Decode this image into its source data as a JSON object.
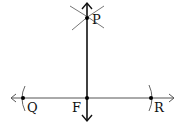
{
  "diagram": {
    "points": [
      {
        "id": "P",
        "label": "P",
        "x": 87,
        "y": 18
      },
      {
        "id": "Q",
        "label": "Q",
        "x": 23,
        "y": 98
      },
      {
        "id": "F",
        "label": "F",
        "x": 87,
        "y": 98
      },
      {
        "id": "R",
        "label": "R",
        "x": 151,
        "y": 98
      }
    ],
    "lines": [
      {
        "id": "QR-line",
        "from": [
          10,
          98
        ],
        "to": [
          175,
          98
        ],
        "arrows": "both"
      },
      {
        "id": "PF-line",
        "from": [
          87,
          3
        ],
        "to": [
          87,
          121
        ],
        "arrows": "both"
      }
    ],
    "arcs": [
      {
        "id": "arc-Q",
        "near": "Q"
      },
      {
        "id": "arc-R",
        "near": "R"
      },
      {
        "id": "arc-P-left",
        "near": "P"
      },
      {
        "id": "arc-P-right",
        "near": "P"
      }
    ],
    "colors": {
      "line": "#333333",
      "arc": "#777777",
      "point": "#000000"
    }
  }
}
